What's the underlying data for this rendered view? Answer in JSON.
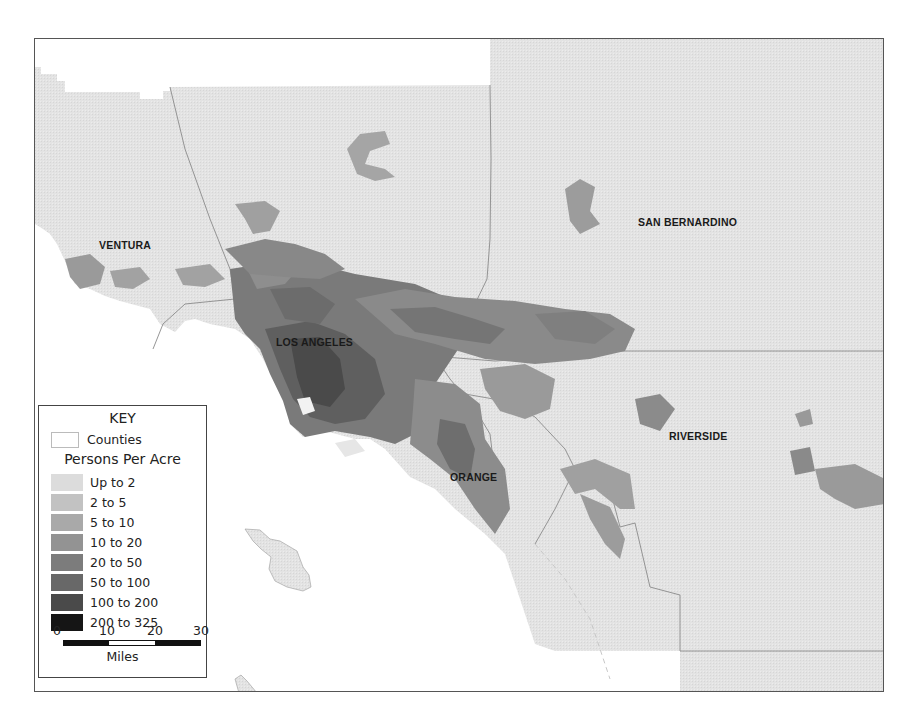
{
  "map": {
    "counties": [
      {
        "name": "VENTURA"
      },
      {
        "name": "LOS ANGELES"
      },
      {
        "name": "SAN BERNARDINO"
      },
      {
        "name": "ORANGE"
      },
      {
        "name": "RIVERSIDE"
      }
    ],
    "colors": {
      "land_base": "#e2e2e2",
      "ocean": "#ffffff",
      "county_border": "#8a8a8a"
    }
  },
  "legend": {
    "title": "KEY",
    "counties_label": "Counties",
    "subtitle": "Persons Per Acre",
    "classes": [
      {
        "label": "Up to 2",
        "color": "#dcdcdc"
      },
      {
        "label": "2 to 5",
        "color": "#c2c2c2"
      },
      {
        "label": "5 to 10",
        "color": "#a9a9a9"
      },
      {
        "label": "10 to 20",
        "color": "#939393"
      },
      {
        "label": "20 to 50",
        "color": "#7c7c7c"
      },
      {
        "label": "50 to 100",
        "color": "#686868"
      },
      {
        "label": "100 to 200",
        "color": "#4a4a4a"
      },
      {
        "label": "200 to 325",
        "color": "#151515"
      }
    ],
    "scale": {
      "ticks": [
        "0",
        "10",
        "20",
        "30"
      ],
      "unit": "Miles"
    }
  }
}
